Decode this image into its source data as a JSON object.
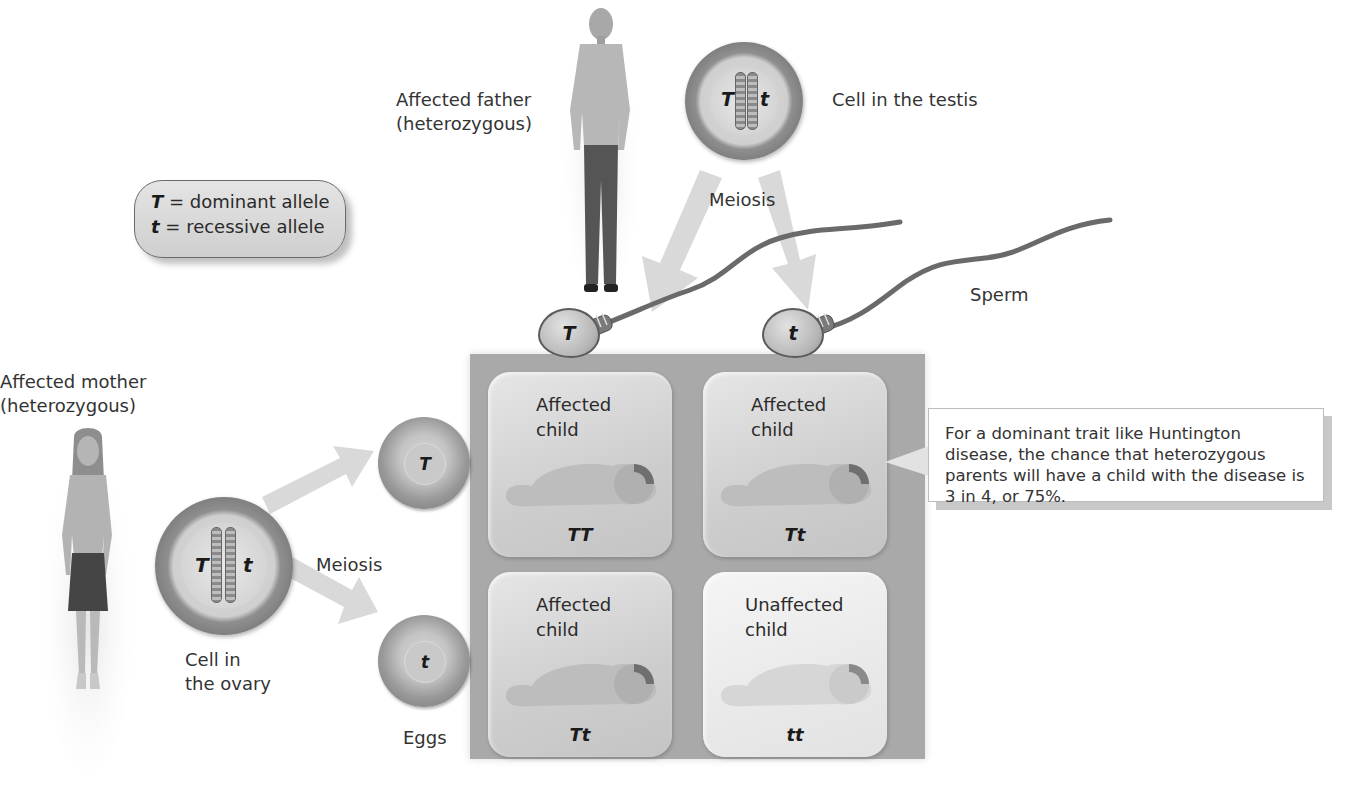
{
  "key": {
    "dominant_symbol": "T",
    "dominant_text": " = dominant allele",
    "recessive_symbol": "t",
    "recessive_text": " = recessive allele"
  },
  "father": {
    "label_line1": "Affected father",
    "label_line2": "(heterozygous)",
    "cell_label": "Cell in the testis",
    "alleles": [
      "T",
      "t"
    ],
    "meiosis_label": "Meiosis",
    "gametes_label": "Sperm",
    "sperm": [
      "T",
      "t"
    ]
  },
  "mother": {
    "label_line1": "Affected mother",
    "label_line2": "(heterozygous)",
    "cell_label_line1": "Cell in",
    "cell_label_line2": "the ovary",
    "alleles": [
      "T",
      "t"
    ],
    "meiosis_label": "Meiosis",
    "gametes_label": "Eggs",
    "eggs": [
      "T",
      "t"
    ]
  },
  "punnett": {
    "cells": [
      {
        "line1": "Affected",
        "line2": "child",
        "genotype": "TT",
        "affected": true
      },
      {
        "line1": "Affected",
        "line2": "child",
        "genotype": "Tt",
        "affected": true
      },
      {
        "line1": "Affected",
        "line2": "child",
        "genotype": "Tt",
        "affected": true
      },
      {
        "line1": "Unaffected",
        "line2": "child",
        "genotype": "tt",
        "affected": false
      }
    ]
  },
  "callout": {
    "text": "For a dominant trait like Huntington disease, the chance that heterozygous parents will have a child with the disease is 3 in 4, or 75%."
  },
  "colors": {
    "arrow": "#d9d9d9",
    "punnett_bg": "#a9a9a9",
    "cell_ring": "#6e6e6e"
  }
}
